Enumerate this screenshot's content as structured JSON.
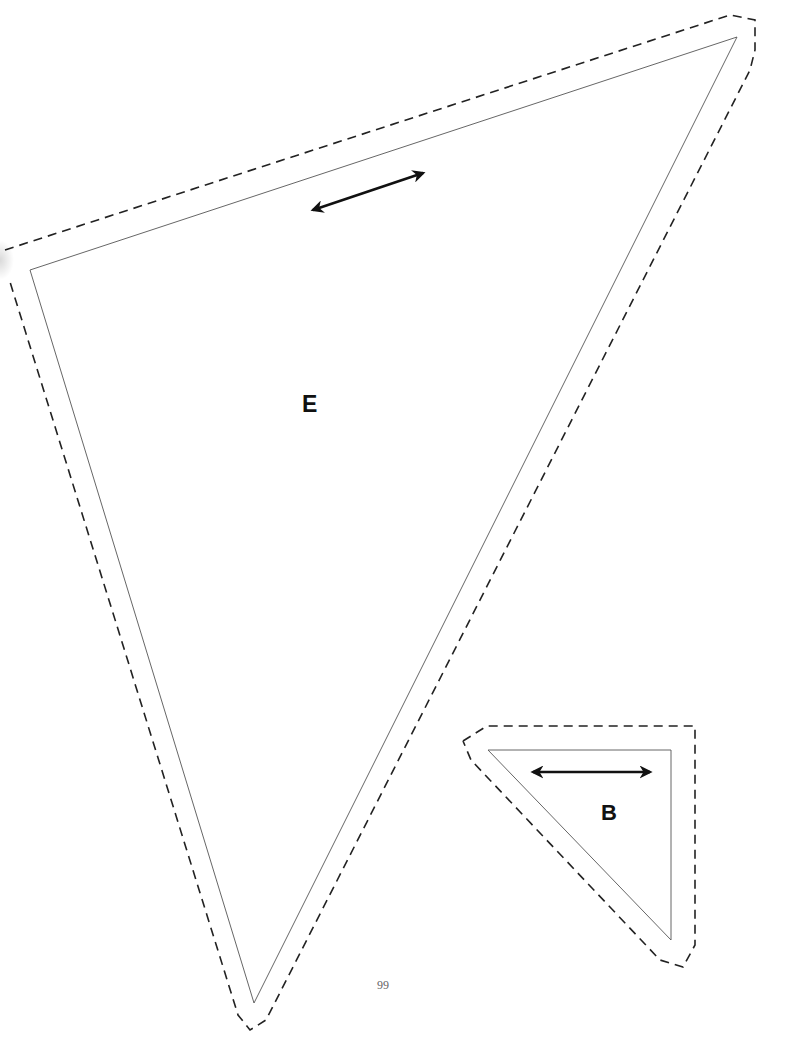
{
  "page": {
    "number": "99",
    "background": "#ffffff",
    "line_color": "#222222",
    "outline_color": "#555555"
  },
  "pieces": [
    {
      "label": "E",
      "stitch_line": [
        [
          30,
          270
        ],
        [
          737,
          37
        ],
        [
          254,
          1003
        ]
      ],
      "cut_line": [
        [
          5,
          250
        ],
        [
          730,
          15
        ],
        [
          755,
          20
        ],
        [
          755,
          50
        ],
        [
          750,
          70
        ],
        [
          266,
          1020
        ],
        [
          250,
          1030
        ],
        [
          238,
          1015
        ],
        [
          10,
          282
        ]
      ],
      "grain_arrow": {
        "from": [
          313,
          210
        ],
        "to": [
          423,
          173
        ]
      }
    },
    {
      "label": "B",
      "stitch_line": [
        [
          488,
          750
        ],
        [
          671,
          750
        ],
        [
          671,
          940
        ]
      ],
      "cut_line": [
        [
          463,
          741
        ],
        [
          487,
          726
        ],
        [
          695,
          726
        ],
        [
          695,
          945
        ],
        [
          683,
          967
        ],
        [
          660,
          960
        ],
        [
          471,
          760
        ]
      ],
      "grain_arrow": {
        "from": [
          533,
          772
        ],
        "to": [
          650,
          772
        ]
      }
    }
  ]
}
